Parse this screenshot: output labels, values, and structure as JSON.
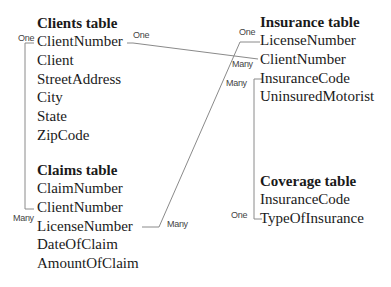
{
  "tables": {
    "clients": {
      "title": "Clients table",
      "fields": [
        "ClientNumber",
        "Client",
        "StreetAddress",
        "City",
        "State",
        "ZipCode"
      ]
    },
    "claims": {
      "title": "Claims table",
      "fields": [
        "ClaimNumber",
        "ClientNumber",
        "LicenseNumber",
        "DateOfClaim",
        "AmountOfClaim"
      ]
    },
    "insurance": {
      "title": "Insurance table",
      "fields": [
        "LicenseNumber",
        "ClientNumber",
        "InsuranceCode",
        "UninsuredMotorist"
      ]
    },
    "coverage": {
      "title": "Coverage table",
      "fields": [
        "InsuranceCode",
        "TypeOfInsurance"
      ]
    }
  },
  "relationships": {
    "clients_claims": {
      "from_label": "One",
      "to_label": "Many"
    },
    "clients_insurance": {
      "from_label": "One",
      "to_label": "Many"
    },
    "claims_insurance": {
      "from_label": "Many",
      "to_label": "One"
    },
    "insurance_coverage": {
      "from_label": "Many",
      "to_label": "One"
    }
  },
  "colors": {
    "line": "#8a8a8a",
    "text": "#1a1a1a",
    "label": "#444444"
  }
}
